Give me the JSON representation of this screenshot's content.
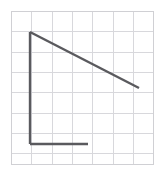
{
  "canvas": {
    "width": 163,
    "height": 172,
    "background_color": "#ffffff",
    "title": "Right triangle on square grid"
  },
  "grid": {
    "label": "square-grid",
    "origin_x": 11,
    "origin_y": 11,
    "cell_size": 20.3,
    "columns": 7,
    "rows": 7.5,
    "right_edge_x": 153,
    "bottom_edge_y": 164,
    "line_color": "#d8d8dc",
    "line_width": 1,
    "outer_border_color": "#d0d0d4"
  },
  "figure": {
    "label": "right-triangle-outline",
    "stroke_color": "#5a5a5e",
    "stroke_width": 2.4,
    "apex_vertex": {
      "x": 30,
      "y": 32
    },
    "corner_vertex": {
      "x": 30,
      "y": 144
    },
    "hypotenuse_end": {
      "x": 139,
      "y": 88
    },
    "base_end": {
      "x": 88,
      "y": 144
    },
    "segments": [
      {
        "name": "vertical-leg",
        "x1": 30,
        "y1": 32,
        "x2": 30,
        "y2": 144
      },
      {
        "name": "horizontal-leg",
        "x1": 30,
        "y1": 144,
        "x2": 88,
        "y2": 144
      },
      {
        "name": "hypotenuse",
        "x1": 30,
        "y1": 32,
        "x2": 139,
        "y2": 88
      }
    ]
  },
  "chart_data": {
    "type": "line",
    "xlabel": "",
    "ylabel": "",
    "xlim": [
      0,
      7
    ],
    "ylim": [
      0,
      7.5
    ],
    "grid": true,
    "legend": "none",
    "series": [
      {
        "name": "vertical-leg",
        "x": [
          0.94,
          0.94
        ],
        "y": [
          5.51,
          0.0
        ]
      },
      {
        "name": "horizontal-leg",
        "x": [
          0.94,
          3.79
        ],
        "y": [
          0.0,
          0.0
        ]
      },
      {
        "name": "hypotenuse",
        "x": [
          0.94,
          6.31
        ],
        "y": [
          5.51,
          2.76
        ]
      }
    ],
    "annotations": []
  }
}
